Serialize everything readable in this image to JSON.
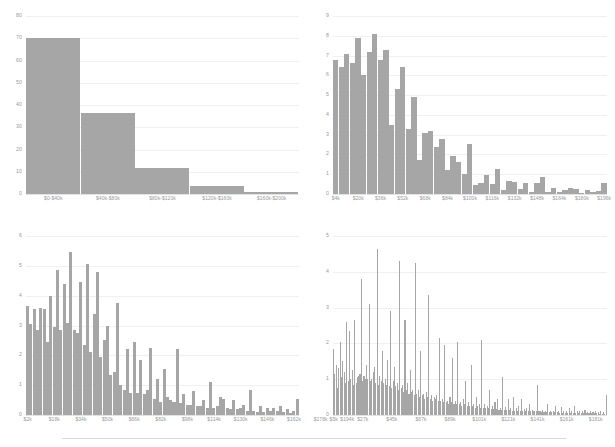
{
  "figure": {
    "layout": "2x2-grid-of-histograms",
    "background_color": "#ffffff",
    "bar_color": "#a6a6a6",
    "gridline_color": "#f0f0f2",
    "axis_text_color": "#9a9a9a",
    "divider_color": "#dcdcdf"
  },
  "chart_data": [
    {
      "id": "top-left",
      "type": "bar",
      "title": "",
      "xlabel": "",
      "ylabel": "",
      "ylim": [
        0,
        80
      ],
      "yticks": [
        0,
        10,
        20,
        30,
        40,
        50,
        60,
        70,
        80
      ],
      "grid": true,
      "legend": "none",
      "categories": [
        "$0-$40k",
        "$40k-$80k",
        "$80k-$120k",
        "$120k-$160k",
        "$160k-$200k"
      ],
      "values": [
        70,
        36.5,
        11.5,
        3.5,
        0.8
      ]
    },
    {
      "id": "top-right",
      "type": "bar",
      "title": "",
      "xlabel": "",
      "ylabel": "",
      "ylim": [
        0,
        9
      ],
      "yticks": [
        0,
        1,
        2,
        3,
        4,
        5,
        6,
        7,
        8,
        9
      ],
      "grid": true,
      "legend": "none",
      "tick_labels": [
        "$4k",
        "$20k",
        "$36k",
        "$52k",
        "$68k",
        "$84k",
        "$100k",
        "$116k",
        "$132k",
        "$148k",
        "$164k",
        "$180k",
        "$196k"
      ],
      "tick_positions": [
        0,
        4,
        8,
        12,
        16,
        20,
        24,
        28,
        32,
        36,
        40,
        44,
        48
      ],
      "bin_width_k": 4,
      "values": [
        6.8,
        6.4,
        7.1,
        6.6,
        7.9,
        6.0,
        7.2,
        8.1,
        6.8,
        7.3,
        3.5,
        5.3,
        6.4,
        3.3,
        4.9,
        1.7,
        3.1,
        3.2,
        2.4,
        2.8,
        1.2,
        1.9,
        1.6,
        1.0,
        2.55,
        0.45,
        0.55,
        0.95,
        0.5,
        1.25,
        0.18,
        0.65,
        0.6,
        0.25,
        0.55,
        0.12,
        0.55,
        0.85,
        0.08,
        0.3,
        0.12,
        0.22,
        0.3,
        0.25,
        0.05,
        0.18,
        0.12,
        0.15,
        0.55
      ]
    },
    {
      "id": "bottom-left",
      "type": "bar",
      "title": "",
      "xlabel": "",
      "ylabel": "",
      "ylim": [
        0,
        6
      ],
      "yticks": [
        0,
        1,
        2,
        3,
        4,
        5,
        6
      ],
      "grid": true,
      "legend": "none",
      "tick_labels": [
        "$2k",
        "$18k",
        "$34k",
        "$50k",
        "$66k",
        "$82k",
        "$98k",
        "$114k",
        "$130k",
        "$146k",
        "$162k",
        "$178k",
        "$194k"
      ],
      "tick_positions": [
        0,
        8,
        16,
        24,
        32,
        40,
        48,
        56,
        64,
        72,
        80,
        88,
        96
      ],
      "bin_width_k": 2,
      "values": [
        3.65,
        3.05,
        3.55,
        2.85,
        3.6,
        3.55,
        2.45,
        4.0,
        2.95,
        4.85,
        2.85,
        4.4,
        3.1,
        5.45,
        2.85,
        2.75,
        4.45,
        2.35,
        5.05,
        2.1,
        3.4,
        4.8,
        1.95,
        2.5,
        3.0,
        1.35,
        1.45,
        3.75,
        1.0,
        0.85,
        2.2,
        0.75,
        2.45,
        0.75,
        1.85,
        0.7,
        0.85,
        2.25,
        0.55,
        1.2,
        0.45,
        1.55,
        0.6,
        0.5,
        0.45,
        2.2,
        0.4,
        0.7,
        0.35,
        0.35,
        0.8,
        0.3,
        0.3,
        0.5,
        0.25,
        1.1,
        0.25,
        0.3,
        0.6,
        0.55,
        0.25,
        0.2,
        0.5,
        0.2,
        0.25,
        0.35,
        0.15,
        0.85,
        0.15,
        0.1,
        0.3,
        0.1,
        0.25,
        0.12,
        0.25,
        0.12,
        0.3,
        0.1,
        0.2,
        0.08,
        0.15,
        0.55
      ]
    },
    {
      "id": "bottom-right",
      "type": "bar",
      "title": "",
      "xlabel": "",
      "ylabel": "",
      "ylim": [
        0,
        5
      ],
      "yticks": [
        0,
        1,
        2,
        3,
        4,
        5
      ],
      "grid": true,
      "legend": "none",
      "tick_labels": [
        "$5k",
        "$27k",
        "$45k",
        "$67k",
        "$89k",
        "$101k",
        "$121k",
        "$141k",
        "$161k",
        "$181k"
      ],
      "tick_positions": [
        0,
        22,
        44,
        66,
        88,
        110,
        132,
        154,
        176,
        198
      ],
      "bin_width_k": 1,
      "values": [
        1.85,
        1.15,
        1.4,
        0.75,
        1.3,
        2.05,
        1.05,
        1.5,
        1.2,
        0.9,
        2.6,
        0.95,
        2.35,
        1.0,
        1.25,
        0.85,
        2.65,
        0.9,
        1.05,
        1.1,
        1.15,
        3.8,
        0.95,
        1.1,
        1.0,
        1.4,
        1.0,
        3.1,
        0.95,
        1.0,
        1.2,
        1.35,
        0.9,
        4.65,
        0.85,
        1.1,
        0.95,
        1.8,
        0.9,
        1.0,
        0.85,
        1.55,
        0.8,
        2.9,
        0.75,
        0.95,
        1.35,
        0.8,
        0.9,
        0.7,
        4.3,
        0.75,
        0.85,
        0.65,
        2.65,
        0.7,
        0.9,
        0.6,
        1.25,
        0.65,
        0.7,
        0.55,
        4.25,
        0.6,
        0.7,
        0.5,
        1.8,
        0.55,
        0.6,
        0.45,
        0.65,
        0.5,
        3.35,
        0.45,
        0.55,
        0.4,
        0.5,
        0.45,
        0.55,
        0.4,
        2.15,
        0.4,
        0.45,
        0.35,
        1.95,
        0.35,
        0.4,
        0.3,
        0.5,
        0.35,
        1.6,
        0.3,
        0.4,
        0.3,
        2.05,
        0.3,
        0.35,
        0.25,
        0.45,
        0.3,
        0.95,
        0.25,
        0.35,
        0.25,
        1.4,
        0.25,
        0.3,
        0.2,
        0.5,
        0.25,
        0.3,
        0.2,
        2.1,
        0.2,
        0.3,
        0.2,
        0.25,
        0.2,
        0.7,
        0.18,
        0.25,
        0.18,
        0.35,
        0.18,
        0.45,
        0.15,
        0.2,
        0.15,
        1.05,
        0.15,
        0.22,
        0.15,
        0.45,
        0.15,
        0.2,
        0.12,
        0.5,
        0.12,
        0.2,
        0.12,
        0.25,
        0.12,
        0.45,
        0.12,
        0.18,
        0.1,
        0.2,
        0.1,
        0.3,
        0.1,
        0.15,
        0.1,
        0.12,
        0.1,
        0.85,
        0.1,
        0.12,
        0.08,
        0.15,
        0.08,
        0.12,
        0.08,
        0.3,
        0.08,
        0.1,
        0.08,
        0.12,
        0.08,
        0.25,
        0.08,
        0.1,
        0.06,
        0.22,
        0.06,
        0.1,
        0.06,
        0.12,
        0.06,
        0.2,
        0.06,
        0.1,
        0.06,
        0.25,
        0.06,
        0.1,
        0.05,
        0.12,
        0.05,
        0.1,
        0.05,
        0.15,
        0.05,
        0.08,
        0.05,
        0.1,
        0.05,
        0.08,
        0.05,
        0.1,
        0.05,
        0.08,
        0.04,
        0.1,
        0.04,
        0.08,
        0.04,
        0.55
      ]
    }
  ]
}
